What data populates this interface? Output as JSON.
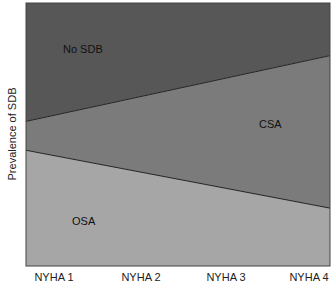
{
  "chart_data": {
    "type": "area",
    "stacked": true,
    "normalized": true,
    "title": "",
    "xlabel": "",
    "ylabel": "Prevalence of SDB",
    "categories": [
      "NYHA 1",
      "NYHA 2",
      "NYHA 3",
      "NYHA 4"
    ],
    "series": [
      {
        "name": "OSA",
        "values": [
          44,
          37,
          29,
          22
        ],
        "color": "#a6a6a6"
      },
      {
        "name": "CSA",
        "values": [
          11,
          27,
          42,
          58
        ],
        "color": "#7b7b7b"
      },
      {
        "name": "No SDB",
        "values": [
          45,
          36,
          29,
          20
        ],
        "color": "#575757"
      }
    ],
    "ylim": [
      0,
      100
    ],
    "grid": false,
    "legend": "inline region labels"
  },
  "labels": {
    "ylabel": "Prevalence of SDB",
    "no_sdb": "No SDB",
    "csa": "CSA",
    "osa": "OSA",
    "x": [
      "NYHA 1",
      "NYHA 2",
      "NYHA 3",
      "NYHA 4"
    ]
  }
}
